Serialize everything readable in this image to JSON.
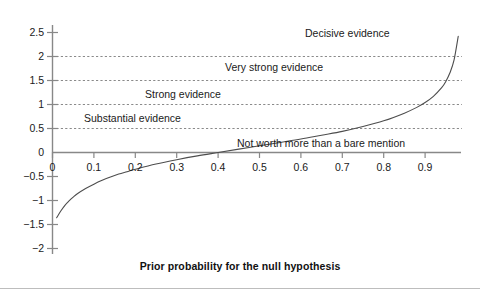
{
  "chart_data": {
    "type": "line",
    "title": "",
    "xlabel": "Prior probability for the null hypothesis",
    "ylabel": "",
    "xlim": [
      0.0,
      0.985
    ],
    "ylim": [
      -2.0,
      2.75
    ],
    "grid": "horizontal dashed gridlines at y = 0.5, 1, 1.5, 2",
    "legend": "none",
    "xticks": [
      "0",
      "0.1",
      "0.2",
      "0.3",
      "0.4",
      "0.5",
      "0.6",
      "0.7",
      "0.8",
      "0.9"
    ],
    "xtick_values": [
      0,
      0.1,
      0.2,
      0.3,
      0.4,
      0.5,
      0.6,
      0.7,
      0.8,
      0.9
    ],
    "yticks": [
      "2.5",
      "2",
      "1.5",
      "1",
      "0.5",
      "0",
      "-0.5",
      "-1",
      "-1.5",
      "-2"
    ],
    "ytick_values": [
      2.5,
      2,
      1.5,
      1,
      0.5,
      0,
      -0.5,
      -1,
      -1.5,
      -2
    ],
    "series": [
      {
        "name": "log10 Bayes factor bound",
        "x": [
          0.01,
          0.02,
          0.03,
          0.04,
          0.05,
          0.06,
          0.08,
          0.1,
          0.12,
          0.14,
          0.16,
          0.18,
          0.2,
          0.25,
          0.3,
          0.35,
          0.4,
          0.45,
          0.5,
          0.55,
          0.6,
          0.65,
          0.7,
          0.75,
          0.8,
          0.85,
          0.88,
          0.9,
          0.92,
          0.94,
          0.95,
          0.96,
          0.97,
          0.98
        ],
        "y": [
          -1.36,
          -1.22,
          -1.1,
          -1.01,
          -0.93,
          -0.86,
          -0.75,
          -0.66,
          -0.58,
          -0.51,
          -0.45,
          -0.4,
          -0.35,
          -0.24,
          -0.15,
          -0.07,
          0.0,
          0.07,
          0.14,
          0.21,
          0.28,
          0.36,
          0.44,
          0.54,
          0.66,
          0.82,
          0.94,
          1.04,
          1.17,
          1.35,
          1.48,
          1.66,
          1.93,
          2.42
        ]
      }
    ],
    "annotations": [
      {
        "text": "Decisive evidence",
        "x_px": 305,
        "y_px": 33,
        "band": "above 2"
      },
      {
        "text": "Very strong evidence",
        "x_px": 225,
        "y_px": 67,
        "band": "1.5 to 2"
      },
      {
        "text": "Strong evidence",
        "x_px": 145,
        "y_px": 94,
        "band": "1 to 1.5"
      },
      {
        "text": "Substantial evidence",
        "x_px": 85,
        "y_px": 118,
        "band": "0.5 to 1"
      },
      {
        "text": "Not worth more than a bare mention",
        "x_px": 237,
        "y_px": 143,
        "band": "0 to 0.5"
      }
    ],
    "colors": {
      "curve": "#4d4d4d",
      "axis": "#808080",
      "gridline": "#808080",
      "text": "#1a1a1a",
      "background": "#ffffff",
      "bottom_rule": "#bdbdbd"
    }
  },
  "axis": {
    "x_title": "Prior probability for the null hypothesis"
  },
  "ytick_labels": [
    "2.5",
    "2",
    "1.5",
    "1",
    "0.5",
    "0",
    "−0.5",
    "−1",
    "−1.5",
    "−2"
  ],
  "xtick_labels": [
    "0",
    "0.1",
    "0.2",
    "0.3",
    "0.4",
    "0.5",
    "0.6",
    "0.7",
    "0.8",
    "0.9"
  ],
  "region_labels": [
    "Decisive evidence",
    "Very strong evidence",
    "Strong evidence",
    "Substantial evidence",
    "Not worth more than a bare mention"
  ]
}
